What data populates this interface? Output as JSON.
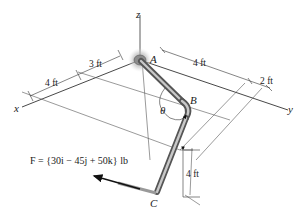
{
  "figure": {
    "axes": {
      "x": "x",
      "y": "y",
      "z": "z"
    },
    "points": {
      "A": "A",
      "B": "B",
      "C": "C"
    },
    "angle": "θ",
    "dimensions": {
      "d_x_outer": "4 ft",
      "d_x_inner": "3 ft",
      "d_y_AB": "4 ft",
      "d_y_offset": "2 ft",
      "d_z_C": "4 ft"
    },
    "force": {
      "symbol": "F",
      "expression": "F = {30i − 45j + 50k} lb",
      "components": {
        "i": 30,
        "j": -45,
        "k": 50,
        "unit": "lb"
      }
    },
    "colors": {
      "line": "#333333",
      "guide": "#555555",
      "rod": "#8a8a8a",
      "rod_highlight": "#c8c8c8",
      "support": "#9a9a9a"
    }
  }
}
